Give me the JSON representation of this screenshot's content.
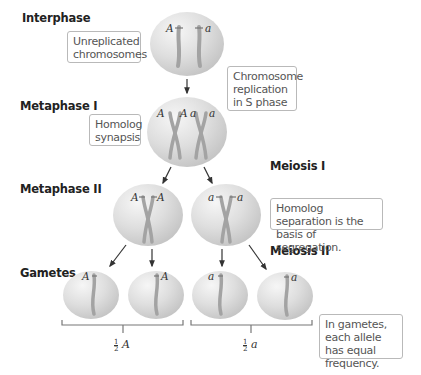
{
  "stages": {
    "interphase": "Interphase",
    "metaphase1": "Metaphase I",
    "metaphase2": "Metaphase II",
    "gametes": "Gametes",
    "meiosis1": "Meiosis I",
    "meiosis2": "Meiosis II"
  },
  "notes": {
    "unreplicated": "Unreplicated chromosomes",
    "replication": "Chromosome replication in S phase",
    "synapsis": "Homolog synapsis",
    "separation": "Homolog separation is the basis of segregation.",
    "equal_frequency": "In gametes, each allele has equal frequency."
  },
  "alleles": {
    "dominant": "A",
    "recessive": "a"
  },
  "fractions": {
    "left": {
      "num": "1",
      "den": "2",
      "allele": "A"
    },
    "right": {
      "num": "1",
      "den": "2",
      "allele": "a"
    }
  },
  "colors": {
    "cell": "#d9d9d9",
    "cell_highlight": "#f4f4f4",
    "chromosome": "#a3a3a3",
    "note_border": "#b9b9b9",
    "text": "#222222"
  }
}
